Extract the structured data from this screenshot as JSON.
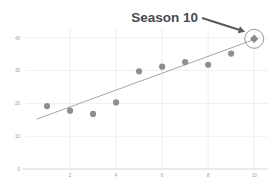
{
  "chart_data": {
    "type": "scatter",
    "title": "",
    "xlabel": "",
    "ylabel": "",
    "x": [
      1,
      2,
      3,
      4,
      5,
      6,
      7,
      8,
      9,
      10
    ],
    "values": [
      19.2,
      17.8,
      16.8,
      20.3,
      29.8,
      31.2,
      32.6,
      31.8,
      35.2,
      39.7
    ],
    "series": [
      {
        "name": "Season points",
        "x": [
          1,
          2,
          3,
          4,
          5,
          6,
          7,
          8,
          9,
          10
        ],
        "values": [
          19.2,
          17.8,
          16.8,
          20.3,
          29.8,
          31.2,
          32.6,
          31.8,
          35.2,
          39.7
        ]
      },
      {
        "name": "Trend line",
        "type": "line",
        "x": [
          0.55,
          10.0
        ],
        "values": [
          15.2,
          39.5
        ]
      }
    ],
    "xlim": [
      0,
      10.6
    ],
    "ylim": [
      0,
      43
    ],
    "xticks": [
      2,
      4,
      6,
      8,
      10
    ],
    "xtick_labels": [
      "2",
      "4",
      "6",
      "8",
      "10"
    ],
    "yticks": [
      0,
      10,
      20,
      30,
      40
    ],
    "ytick_labels": [
      "0",
      "10",
      "20",
      "30",
      "40"
    ],
    "grid": true,
    "legend": "none",
    "highlight": {
      "x": 10,
      "y": 39.7,
      "marker": "diamond",
      "circled": true
    },
    "annotations": [
      {
        "text": "Season 10",
        "target_x": 10,
        "target_y": 39.7,
        "arrow": true
      }
    ],
    "colors": {
      "point": "#8e8e93",
      "trend": "#9a9aa0",
      "grid": "#e9eaee",
      "axis": "#c9ccd2",
      "tick_text": "#9a9ea6",
      "annotation_text": "#4a4a4f",
      "arrow": "#5a5a60"
    }
  }
}
